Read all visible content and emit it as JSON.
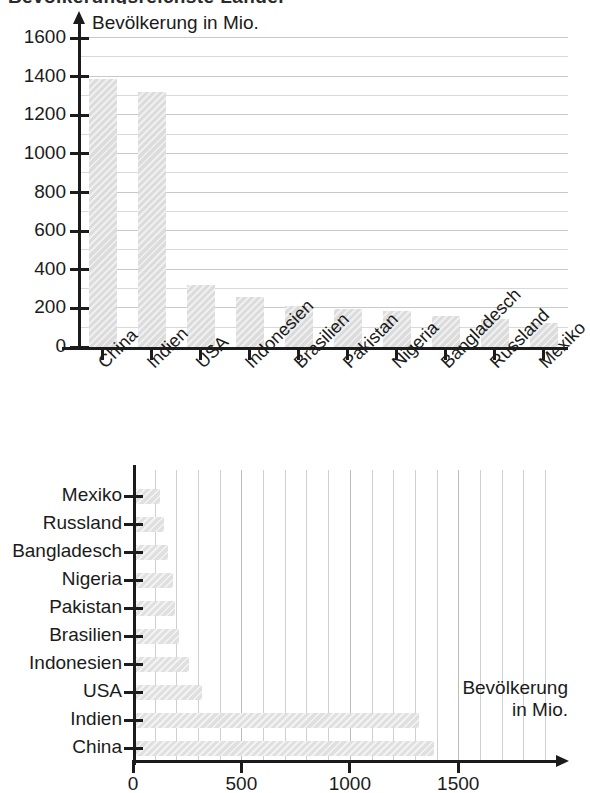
{
  "page": {
    "cropped_heading": "Bevölkerungsreichste Länder"
  },
  "chart_data": [
    {
      "id": "chart-vertical",
      "type": "bar",
      "orientation": "vertical",
      "title": "Bevölkerung in Mio.",
      "xlabel": "",
      "ylabel": "Bevölkerung in Mio.",
      "ylim": [
        0,
        1600
      ],
      "ytick_step": 200,
      "minor_gridline_step": 100,
      "grid": true,
      "legend": "none",
      "categories": [
        "China",
        "Indien",
        "USA",
        "Indonesien",
        "Brasilien",
        "Pakistan",
        "Nigeria",
        "Bangladesch",
        "Russland",
        "Mexiko"
      ],
      "values": [
        1390,
        1320,
        320,
        260,
        210,
        195,
        185,
        160,
        145,
        125
      ],
      "ytick_labels": [
        "0",
        "200",
        "400",
        "600",
        "800",
        "1000",
        "1200",
        "1400",
        "1600"
      ],
      "bar_color": "#dcdcdc",
      "axis_color": "#1b1b1b",
      "grid_color": "#d9d9d9"
    },
    {
      "id": "chart-horizontal",
      "type": "bar",
      "orientation": "horizontal",
      "title": "",
      "xlabel_line1": "Bevölkerung",
      "xlabel_line2": "in Mio.",
      "ylabel": "",
      "xlim": [
        0,
        1960
      ],
      "xtick_step": 500,
      "minor_gridline_step": 100,
      "grid": true,
      "legend": "none",
      "categories": [
        "Mexiko",
        "Russland",
        "Bangladesch",
        "Nigeria",
        "Pakistan",
        "Brasilien",
        "Indonesien",
        "USA",
        "Indien",
        "China"
      ],
      "values": [
        125,
        145,
        160,
        185,
        195,
        210,
        260,
        320,
        1320,
        1390
      ],
      "xtick_labels": [
        "0",
        "500",
        "1000",
        "1500"
      ],
      "bar_color": "#e0e0e0",
      "axis_color": "#1b1b1b",
      "grid_color": "#cfcfcf"
    }
  ]
}
